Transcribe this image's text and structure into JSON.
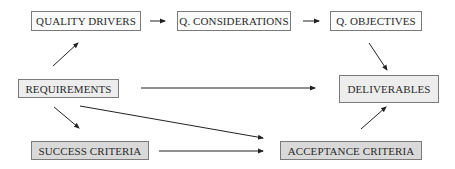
{
  "diagram": {
    "nodes": {
      "quality_drivers": {
        "label": "QUALITY DRIVERS"
      },
      "q_considerations": {
        "label": "Q. CONSIDERATIONS"
      },
      "q_objectives": {
        "label": "Q. OBJECTIVES"
      },
      "requirements": {
        "label": "REQUIREMENTS"
      },
      "deliverables": {
        "label": "DELIVERABLES"
      },
      "success_criteria": {
        "label": "SUCCESS CRITERIA"
      },
      "acceptance_criteria": {
        "label": "ACCEPTANCE CRITERIA"
      }
    },
    "edges": [
      {
        "from": "QUALITY DRIVERS",
        "to": "Q. CONSIDERATIONS"
      },
      {
        "from": "Q. CONSIDERATIONS",
        "to": "Q. OBJECTIVES"
      },
      {
        "from": "Q. OBJECTIVES",
        "to": "DELIVERABLES"
      },
      {
        "from": "REQUIREMENTS",
        "to": "QUALITY DRIVERS"
      },
      {
        "from": "REQUIREMENTS",
        "to": "DELIVERABLES"
      },
      {
        "from": "REQUIREMENTS",
        "to": "ACCEPTANCE CRITERIA"
      },
      {
        "from": "REQUIREMENTS",
        "to": "SUCCESS CRITERIA"
      },
      {
        "from": "SUCCESS CRITERIA",
        "to": "ACCEPTANCE CRITERIA"
      },
      {
        "from": "ACCEPTANCE CRITERIA",
        "to": "DELIVERABLES"
      }
    ],
    "colors": {
      "border": "#7a7a7a",
      "arrow": "#222222",
      "fill_white": "#fbfbfb",
      "fill_light": "#ededed",
      "fill_mid": "#d9d9d9"
    }
  }
}
